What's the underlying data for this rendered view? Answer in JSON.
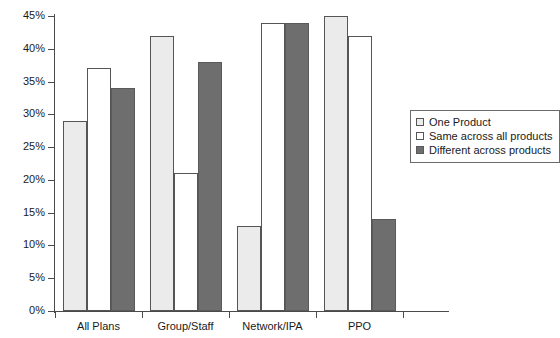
{
  "chart_data": {
    "type": "bar",
    "title": "",
    "subtitle": "",
    "xlabel": "",
    "ylabel": "",
    "categories": [
      "All Plans",
      "Group/Staff",
      "Network/IPA",
      "PPO"
    ],
    "series": [
      {
        "name": "One Product",
        "values": [
          29,
          42,
          13,
          45
        ],
        "color": "#ebebeb"
      },
      {
        "name": "Same across all products",
        "values": [
          37,
          21,
          44,
          42
        ],
        "color": "#ffffff"
      },
      {
        "name": "Different across products",
        "values": [
          34,
          38,
          44,
          14
        ],
        "color": "#6e6e6e"
      }
    ],
    "ylim": [
      0,
      45
    ],
    "ytick_values": [
      0,
      5,
      10,
      15,
      20,
      25,
      30,
      35,
      40,
      45
    ],
    "ytick_labels": [
      "0%",
      "5%",
      "10%",
      "15%",
      "20%",
      "25%",
      "30%",
      "35%",
      "40%",
      "45%"
    ],
    "grid": false,
    "legend_position": "right",
    "value_suffix": "%"
  },
  "legend": {
    "entries": [
      {
        "label": "One Product",
        "swatch": "light-gray-square"
      },
      {
        "label": "Same across all products",
        "swatch": "white-square"
      },
      {
        "label": "Different across products",
        "swatch": "dark-gray-square"
      }
    ]
  },
  "axis": {
    "y_labels": [
      "45%",
      "40%",
      "35%",
      "30%",
      "25%",
      "20%",
      "15%",
      "10%",
      "5%",
      "0%"
    ],
    "x_labels": [
      "All Plans",
      "Group/Staff",
      "Network/IPA",
      "PPO"
    ]
  },
  "colors": {
    "series_one_product": "#ebebeb",
    "series_same_across": "#ffffff",
    "series_different_across": "#6e6e6e",
    "axis": "#4a4a4a",
    "bar_outline": "#555555",
    "background": "#ffffff",
    "text": "#1a1a1a"
  }
}
